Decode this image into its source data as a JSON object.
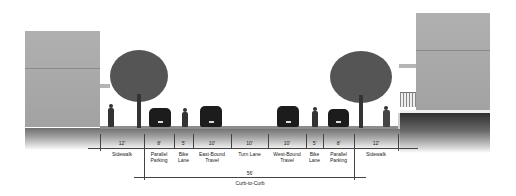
{
  "diagram": {
    "type": "street-cross-section",
    "colors": {
      "building": "#a9a9a9",
      "ground_dark": "#3a3a3a",
      "canopy": "#555555",
      "vehicle": "#1c1c1c",
      "text": "#222222"
    },
    "segments": [
      {
        "width": "12'",
        "label": "Sidewalk"
      },
      {
        "width": "8'",
        "label": "Parallel\nParking"
      },
      {
        "width": "5'",
        "label": "Bike\nLane"
      },
      {
        "width": "10'",
        "label": "East-Bound\nTravel"
      },
      {
        "width": "10'",
        "label": "Turn Lane"
      },
      {
        "width": "10'",
        "label": "West-Bound\nTravel"
      },
      {
        "width": "5'",
        "label": "Bike\nLane"
      },
      {
        "width": "8'",
        "label": "Parallel\nParking"
      },
      {
        "width": "12'",
        "label": "Sidewalk"
      }
    ],
    "total": {
      "width": "56'",
      "label": "Curb-to-Curb"
    }
  }
}
